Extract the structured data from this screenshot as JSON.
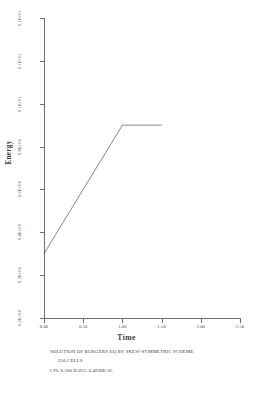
{
  "chart_data": {
    "type": "line",
    "title": "SOLUTION OF BURGERS EQ BY SKEW-SYMMETRIC SCHEME",
    "xlabel": "Time",
    "ylabel": "Energy",
    "xlim": [
      0.0,
      2.5
    ],
    "ylim": [
      0.0,
      1.4
    ],
    "grid": false,
    "legend": null,
    "x_ticks": [
      0.0,
      0.5,
      1.0,
      1.5,
      2.0,
      2.5
    ],
    "x_tick_labels": [
      "0.00",
      "0.50",
      "1.00",
      "1.50",
      "2.00",
      "2.50"
    ],
    "y_ticks": [
      0.0,
      0.2,
      0.4,
      0.6,
      0.8,
      1.0,
      1.2,
      1.4
    ],
    "y_tick_labels": [
      "0.0E+00",
      "0.2E+00",
      "0.4E+00",
      "0.6E+00",
      "0.8E+00",
      "0.1E+01",
      "0.1E+01",
      "0.1E+01"
    ],
    "series": [
      {
        "name": "energy",
        "x": [
          0.0,
          1.0,
          1.5
        ],
        "y": [
          0.3,
          0.9,
          0.9
        ]
      }
    ]
  },
  "caption": {
    "line1": "SOLUTION OF BURGERS EQ BY SKEW-SYMMETRIC SCHEME",
    "line2": "256   CELLS",
    "line3": "CFL  0.500  RAVG 0.4938E-05"
  },
  "colors": {
    "axis": "#6e6e6e",
    "line": "#555555",
    "text": "#3a3a3a",
    "background": "#ffffff"
  }
}
